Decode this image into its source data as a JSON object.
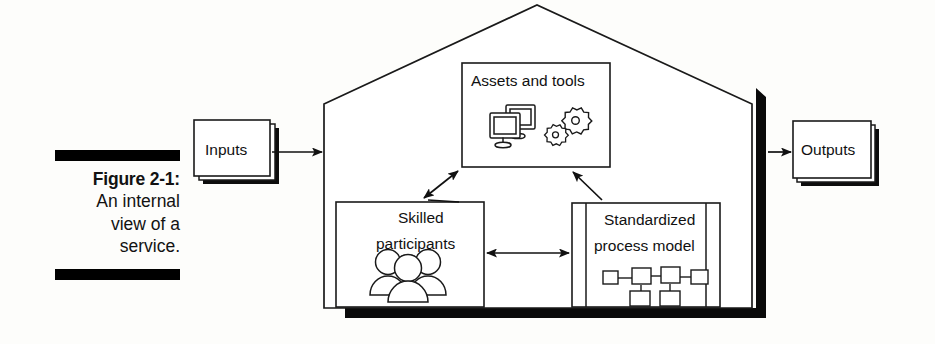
{
  "figure": {
    "caption": {
      "title": "Figure 2-1:",
      "lines": [
        "An internal",
        "view of a",
        "service."
      ]
    },
    "title_full": "Figure 2-1: An internal view of a service.",
    "type": "block-diagram",
    "container": {
      "name": "service-house",
      "shape": "house-pentagon",
      "shadow_color": "#000000",
      "border_color": "#1a1a1a",
      "fill_color": "#ffffff"
    },
    "external_nodes": [
      {
        "id": "inputs",
        "label": "Inputs",
        "shape": "stacked-rectangle",
        "position": "left-outside"
      },
      {
        "id": "outputs",
        "label": "Outputs",
        "shape": "stacked-rectangle",
        "position": "right-outside"
      }
    ],
    "internal_nodes": [
      {
        "id": "assets-and-tools",
        "label": "Assets and tools",
        "shape": "rectangle",
        "icons": [
          "monitor-icon",
          "monitor-icon",
          "gear-icon",
          "gear-icon"
        ]
      },
      {
        "id": "skilled-participants",
        "label_line_1": "Skilled",
        "label_line_2": "participants",
        "label": "Skilled participants",
        "shape": "rectangle",
        "icons": [
          "person-icon",
          "person-icon",
          "person-icon"
        ]
      },
      {
        "id": "standardized-process-model",
        "label_line_1": "Standardized",
        "label_line_2": "process model",
        "label": "Standardized process model",
        "shape": "predefined-process-rectangle",
        "icons": [
          "flowchart-icon"
        ]
      }
    ],
    "connectors": [
      {
        "id": "inputs-to-house",
        "from": "inputs",
        "to": "service-house",
        "heads": "single",
        "orientation": "horizontal"
      },
      {
        "id": "house-to-outputs",
        "from": "service-house",
        "to": "outputs",
        "heads": "single",
        "orientation": "horizontal"
      },
      {
        "id": "skilled-to-assets",
        "from": "skilled-participants",
        "to": "assets-and-tools",
        "heads": "double",
        "orientation": "diagonal"
      },
      {
        "id": "process-to-assets",
        "from": "standardized-process-model",
        "to": "assets-and-tools",
        "heads": "single",
        "orientation": "diagonal"
      },
      {
        "id": "skilled-to-process",
        "from": "skilled-participants",
        "to": "standardized-process-model",
        "heads": "double",
        "orientation": "horizontal"
      }
    ]
  }
}
